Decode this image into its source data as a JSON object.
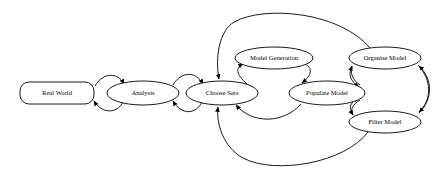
{
  "diagram": {
    "type": "flow-diagram",
    "background_color": "#ffffff",
    "line_color": "#000000",
    "text_color": "#000000",
    "nodes": [
      {
        "id": "real-world",
        "label": "Real World",
        "shape": "rounded-rectangle",
        "cx": 57,
        "cy": 93,
        "rx": 37,
        "ry": 11,
        "font_size": 6.6
      },
      {
        "id": "analysis",
        "label": "Analysis",
        "shape": "ellipse",
        "cx": 143,
        "cy": 93,
        "rx": 36,
        "ry": 12,
        "font_size": 6.6
      },
      {
        "id": "choose-sets",
        "label": "Choose Sets",
        "shape": "ellipse",
        "cx": 222,
        "cy": 93,
        "rx": 36,
        "ry": 12,
        "font_size": 6.6
      },
      {
        "id": "model-generation",
        "label": "Model Generation",
        "shape": "ellipse",
        "cx": 274,
        "cy": 58,
        "rx": 39,
        "ry": 11,
        "font_size": 6.6
      },
      {
        "id": "populate-model",
        "label": "Populate Model",
        "shape": "ellipse",
        "cx": 327,
        "cy": 93,
        "rx": 38,
        "ry": 12,
        "font_size": 6.6
      },
      {
        "id": "organise-model",
        "label": "Organise Model",
        "shape": "ellipse",
        "cx": 385,
        "cy": 58,
        "rx": 36,
        "ry": 11,
        "font_size": 6.6
      },
      {
        "id": "filter-model",
        "label": "Filter Model",
        "shape": "ellipse",
        "cx": 385,
        "cy": 122,
        "rx": 36,
        "ry": 11,
        "font_size": 6.6
      }
    ],
    "edges": [
      {
        "id": "real-world-to-analysis",
        "from": "real-world",
        "to": "analysis",
        "style": "curved-arc",
        "direction": "forward"
      },
      {
        "id": "analysis-to-real-world",
        "from": "analysis",
        "to": "real-world",
        "style": "curved-arc",
        "direction": "back"
      },
      {
        "id": "analysis-to-choose-sets",
        "from": "analysis",
        "to": "choose-sets",
        "style": "curved-arc",
        "direction": "forward"
      },
      {
        "id": "choose-sets-to-analysis",
        "from": "choose-sets",
        "to": "analysis",
        "style": "curved-arc",
        "direction": "back"
      },
      {
        "id": "choose-sets-to-model-generation",
        "from": "choose-sets",
        "to": "model-generation",
        "style": "curved-arc",
        "direction": "forward"
      },
      {
        "id": "model-generation-to-populate-model",
        "from": "model-generation",
        "to": "populate-model",
        "style": "curved-arc",
        "direction": "forward"
      },
      {
        "id": "populate-model-to-choose-sets",
        "from": "populate-model",
        "to": "choose-sets",
        "style": "curved-arc",
        "direction": "back"
      },
      {
        "id": "populate-model-to-organise-model",
        "from": "populate-model",
        "to": "organise-model",
        "style": "short-arc",
        "direction": "bidirectional"
      },
      {
        "id": "populate-model-to-filter-model",
        "from": "populate-model",
        "to": "filter-model",
        "style": "short-arc",
        "direction": "bidirectional"
      },
      {
        "id": "organise-model-to-filter-model",
        "from": "organise-model",
        "to": "filter-model",
        "style": "right-outer-arc",
        "direction": "bidirectional"
      },
      {
        "id": "organise-model-to-choose-sets",
        "from": "organise-model",
        "to": "choose-sets",
        "style": "large-top-arc",
        "direction": "back"
      },
      {
        "id": "filter-model-to-choose-sets",
        "from": "filter-model",
        "to": "choose-sets",
        "style": "large-bottom-arc",
        "direction": "back"
      }
    ]
  }
}
